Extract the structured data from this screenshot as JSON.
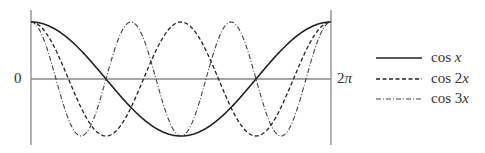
{
  "chart_data": {
    "type": "line",
    "title": "",
    "xlabel": "",
    "ylabel": "",
    "x_ticks": [
      "0",
      "2π"
    ],
    "xlim": [
      0,
      6.2832
    ],
    "ylim": [
      -1,
      1
    ],
    "grid": false,
    "legend_position": "right",
    "series": [
      {
        "name": "cos x",
        "style": "solid",
        "formula": "cos(x)"
      },
      {
        "name": "cos 2x",
        "style": "dashed",
        "formula": "cos(2x)"
      },
      {
        "name": "cos 3x",
        "style": "dash-dot",
        "formula": "cos(3x)"
      }
    ]
  },
  "labels": {
    "zero": "0",
    "two_pi_num": "2",
    "two_pi_sym": "π"
  },
  "legend": [
    {
      "fn": "cos ",
      "arg": "x"
    },
    {
      "fn": "cos 2",
      "arg": "x"
    },
    {
      "fn": "cos 3",
      "arg": "x"
    }
  ]
}
